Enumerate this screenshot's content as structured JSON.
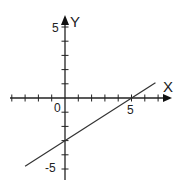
{
  "chart_data": {
    "type": "line",
    "title": "",
    "xlabel": "X",
    "ylabel": "Y",
    "origin_label": "0",
    "x_tick_labels": [
      "5"
    ],
    "y_tick_labels": [
      "5",
      "-5"
    ],
    "xlim": [
      -4,
      7
    ],
    "ylim": [
      -6,
      6
    ],
    "grid": false,
    "series": [
      {
        "name": "line",
        "equation": "y = 0.6x - 3",
        "slope": 0.6,
        "intercept": -3,
        "x": [
          -3,
          6.8
        ],
        "y": [
          -4.8,
          1.08
        ],
        "x_intercept": 5,
        "y_intercept": -3
      }
    ]
  },
  "labels": {
    "x_axis": "X",
    "y_axis": "Y",
    "origin": "0",
    "x_five": "5",
    "y_five": "5",
    "y_minus_five": "-5"
  }
}
